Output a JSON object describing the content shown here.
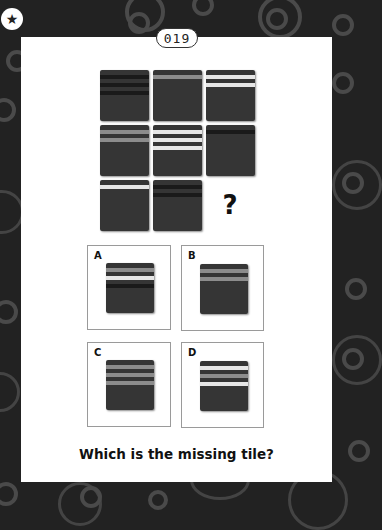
{
  "page_number": "019",
  "badge_icon": "★",
  "colors": {
    "tile_base": "#353535",
    "stripe_black": "#1a1a1a",
    "stripe_gray": "#8c8c8c",
    "stripe_white": "#e6e6e6",
    "background": "#222222"
  },
  "grid": {
    "rows": [
      [
        {
          "stripes": [
            "black",
            "black",
            "black"
          ]
        },
        {
          "stripes": [
            "gray"
          ]
        },
        {
          "stripes": [
            "white",
            "white"
          ]
        }
      ],
      [
        {
          "stripes": [
            "gray",
            "gray"
          ]
        },
        {
          "stripes": [
            "white",
            "white",
            "white"
          ]
        },
        {
          "stripes": [
            "black"
          ]
        }
      ],
      [
        {
          "stripes": [
            "white"
          ]
        },
        {
          "stripes": [
            "black",
            "black"
          ]
        },
        {
          "missing": true,
          "label": "?"
        }
      ]
    ]
  },
  "options": [
    {
      "label": "A",
      "stripes": [
        "gray",
        "white",
        "black"
      ]
    },
    {
      "label": "B",
      "stripes": [
        "gray",
        "gray"
      ]
    },
    {
      "label": "C",
      "stripes": [
        "gray",
        "gray",
        "gray"
      ]
    },
    {
      "label": "D",
      "stripes": [
        "white",
        "gray",
        "white"
      ]
    }
  ],
  "question": "Which is the missing tile?"
}
